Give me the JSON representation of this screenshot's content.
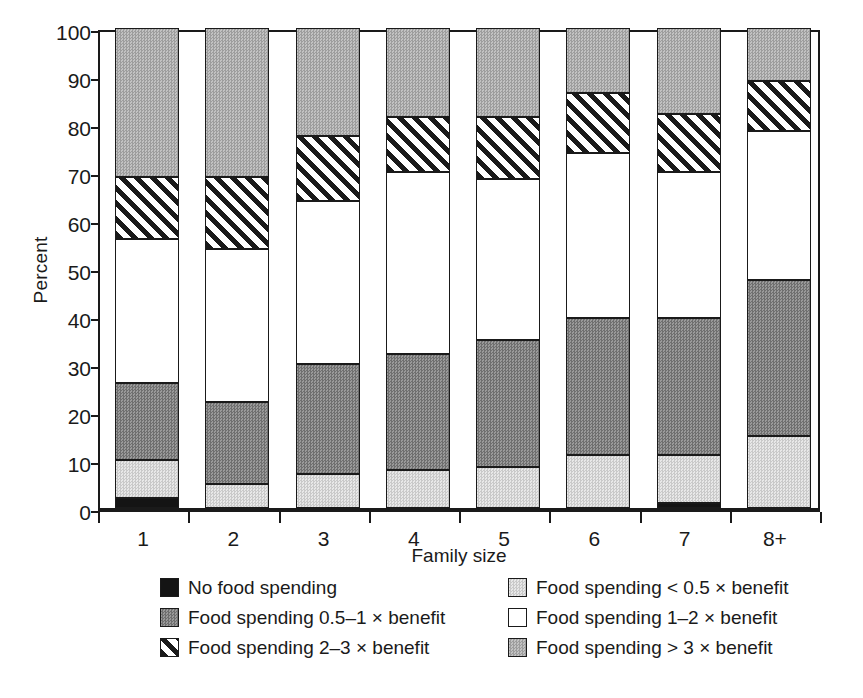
{
  "chart_data": {
    "type": "bar",
    "subtype": "stacked-100-percent",
    "title": "",
    "xlabel": "Family size",
    "ylabel": "Percent",
    "categories": [
      "1",
      "2",
      "3",
      "4",
      "5",
      "6",
      "7",
      "8+"
    ],
    "ylim": [
      0,
      100
    ],
    "yticks": [
      0,
      10,
      20,
      30,
      40,
      50,
      60,
      70,
      80,
      90,
      100
    ],
    "ytick_labels": [
      "0",
      "10",
      "20",
      "30",
      "40",
      "50",
      "60",
      "70",
      "80",
      "90",
      "100"
    ],
    "grid": false,
    "legend_position": "bottom",
    "series": [
      {
        "name": "No food spending",
        "key": "none",
        "fill": "solid-black",
        "color": "#141414",
        "values": [
          2,
          0,
          0,
          0,
          0,
          0,
          1,
          0
        ]
      },
      {
        "name": "Food spending < 0.5 × benefit",
        "key": "lt05",
        "fill": "light-gray-stipple",
        "color": "#d8d8d8",
        "values": [
          8,
          5,
          7,
          8,
          8.5,
          11,
          10,
          15
        ]
      },
      {
        "name": "Food spending 0.5–1 × benefit",
        "key": "05_1",
        "fill": "dark-gray-stipple",
        "color": "#7d7d7d",
        "values": [
          16,
          17,
          23,
          24,
          26.5,
          28.5,
          28.5,
          32.5
        ]
      },
      {
        "name": "Food spending 1–2 × benefit",
        "key": "1_2",
        "fill": "white",
        "color": "#ffffff",
        "values": [
          30,
          32,
          34,
          38,
          33.5,
          34.5,
          30.5,
          31
        ]
      },
      {
        "name": "Food spending 2–3 × benefit",
        "key": "2_3",
        "fill": "diagonal-hatch",
        "color": "#1a1a1a",
        "values": [
          13,
          15,
          13.5,
          11.5,
          13,
          12.5,
          12,
          10.5
        ]
      },
      {
        "name": "Food spending > 3 × benefit",
        "key": "gt3",
        "fill": "medium-gray-stipple",
        "color": "#b0b0b0",
        "values": [
          31,
          31,
          22.5,
          18.5,
          18.5,
          13.5,
          18,
          11
        ]
      }
    ],
    "cumulative_tops": {
      "1": {
        "none": 2,
        "lt05": 10,
        "05_1": 26,
        "1_2": 56,
        "2_3": 69,
        "gt3": 100
      },
      "2": {
        "none": 0,
        "lt05": 5,
        "05_1": 22,
        "1_2": 54,
        "2_3": 69,
        "gt3": 100
      },
      "3": {
        "none": 0,
        "lt05": 7,
        "05_1": 30,
        "1_2": 64,
        "2_3": 77.5,
        "gt3": 100
      },
      "4": {
        "none": 0,
        "lt05": 8,
        "05_1": 32,
        "1_2": 70,
        "2_3": 81.5,
        "gt3": 100
      },
      "5": {
        "none": 0,
        "lt05": 8.5,
        "05_1": 35,
        "1_2": 68.5,
        "2_3": 81.5,
        "gt3": 100
      },
      "6": {
        "none": 0,
        "lt05": 11,
        "05_1": 39.5,
        "1_2": 74,
        "2_3": 86.5,
        "gt3": 100
      },
      "7": {
        "none": 1,
        "lt05": 11,
        "05_1": 39.5,
        "1_2": 70,
        "2_3": 82,
        "gt3": 100
      },
      "8+": {
        "none": 0,
        "lt05": 15,
        "05_1": 47.5,
        "1_2": 78.5,
        "2_3": 89,
        "gt3": 100
      }
    }
  },
  "axes": {
    "ylabel": "Percent",
    "xlabel": "Family size"
  },
  "legend": {
    "rows": [
      [
        {
          "label": "No food spending",
          "key": "none"
        },
        {
          "label": "Food spending < 0.5 × benefit",
          "key": "lt05"
        }
      ],
      [
        {
          "label": "Food spending 0.5–1 × benefit",
          "key": "05_1"
        },
        {
          "label": "Food spending 1–2 × benefit",
          "key": "1_2"
        }
      ],
      [
        {
          "label": "Food spending 2–3 × benefit",
          "key": "2_3"
        },
        {
          "label": "Food spending > 3 × benefit",
          "key": "gt3"
        }
      ]
    ]
  }
}
